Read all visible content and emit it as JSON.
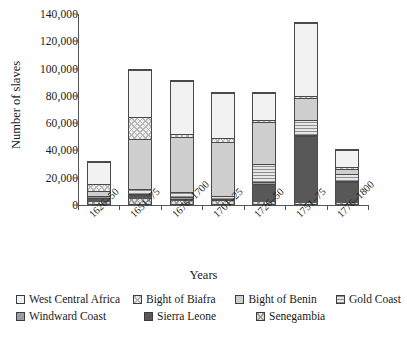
{
  "chart_data": {
    "type": "bar",
    "subtype": "stacked-bar",
    "title": "",
    "xlabel": "Years",
    "ylabel": "Number of slaves",
    "ylim": [
      0,
      140000
    ],
    "ytick_labels": [
      "0",
      "20,000",
      "40,000",
      "60,000",
      "80,000",
      "100,000",
      "120,000",
      "140,000"
    ],
    "ytick_values": [
      0,
      20000,
      40000,
      60000,
      80000,
      100000,
      120000,
      140000
    ],
    "grid": false,
    "legend_position": "bottom",
    "categories": [
      "1626–50",
      "1651–75",
      "1676–1700",
      "1701–25",
      "1726–50",
      "1751–75",
      "1776–1800"
    ],
    "series": [
      {
        "name": "Senegambia",
        "pattern": "crosshatch",
        "values": [
          1500,
          3500,
          2500,
          2000,
          1500,
          1000,
          1000
        ]
      },
      {
        "name": "Sierra Leone",
        "pattern": "solid-dark",
        "values": [
          3500,
          3000,
          1500,
          1000,
          13500,
          49500,
          15500
        ]
      },
      {
        "name": "Windward Coast",
        "pattern": "solid-mid-dark",
        "values": [
          0,
          1000,
          1000,
          1000,
          1500,
          1000,
          1000
        ]
      },
      {
        "name": "Gold Coast",
        "pattern": "horizontal-lines",
        "values": [
          1500,
          3500,
          4000,
          2000,
          13000,
          10500,
          5500
        ]
      },
      {
        "name": "Bight of Benin",
        "pattern": "solid-mid",
        "values": [
          3500,
          37000,
          41000,
          40500,
          32000,
          16500,
          3500
        ]
      },
      {
        "name": "Bight of Biafra",
        "pattern": "diagonal-hatch",
        "values": [
          5000,
          17000,
          2000,
          2500,
          1500,
          1500,
          1500
        ]
      },
      {
        "name": "West Central Africa",
        "pattern": "light-plain",
        "values": [
          17000,
          35000,
          40000,
          34000,
          20000,
          54000,
          13000
        ]
      }
    ],
    "totals": [
      32000,
      100000,
      92000,
      83000,
      83000,
      134000,
      41000
    ]
  },
  "axes": {
    "y_title": "Number of slaves",
    "x_title": "Years"
  },
  "legend": {
    "row1": [
      {
        "label": "West Central Africa",
        "swatch": "light-plain-swatch"
      },
      {
        "label": "Bight of Biafra",
        "swatch": "diagonal-hatch-swatch"
      },
      {
        "label": "Bight of Benin",
        "swatch": "solid-mid-swatch"
      },
      {
        "label": "Gold Coast",
        "swatch": "horizontal-lines-swatch"
      }
    ],
    "row2": [
      {
        "label": "Windward Coast",
        "swatch": "solid-mid-dark-swatch"
      },
      {
        "label": "Sierra Leone",
        "swatch": "solid-dark-swatch"
      },
      {
        "label": "Senegambia",
        "swatch": "crosshatch-swatch"
      }
    ]
  },
  "colors": {
    "west_central_africa": "#f2f2f2",
    "bight_of_biafra": "#ededed",
    "bight_of_benin": "#cfcfcf",
    "gold_coast": "#e6e6e6",
    "windward_coast": "#9d9d9d",
    "sierra_leone": "#585858",
    "senegambia": "#e0e0e0",
    "axis": "#555555",
    "outline": "#4a4a4a"
  }
}
